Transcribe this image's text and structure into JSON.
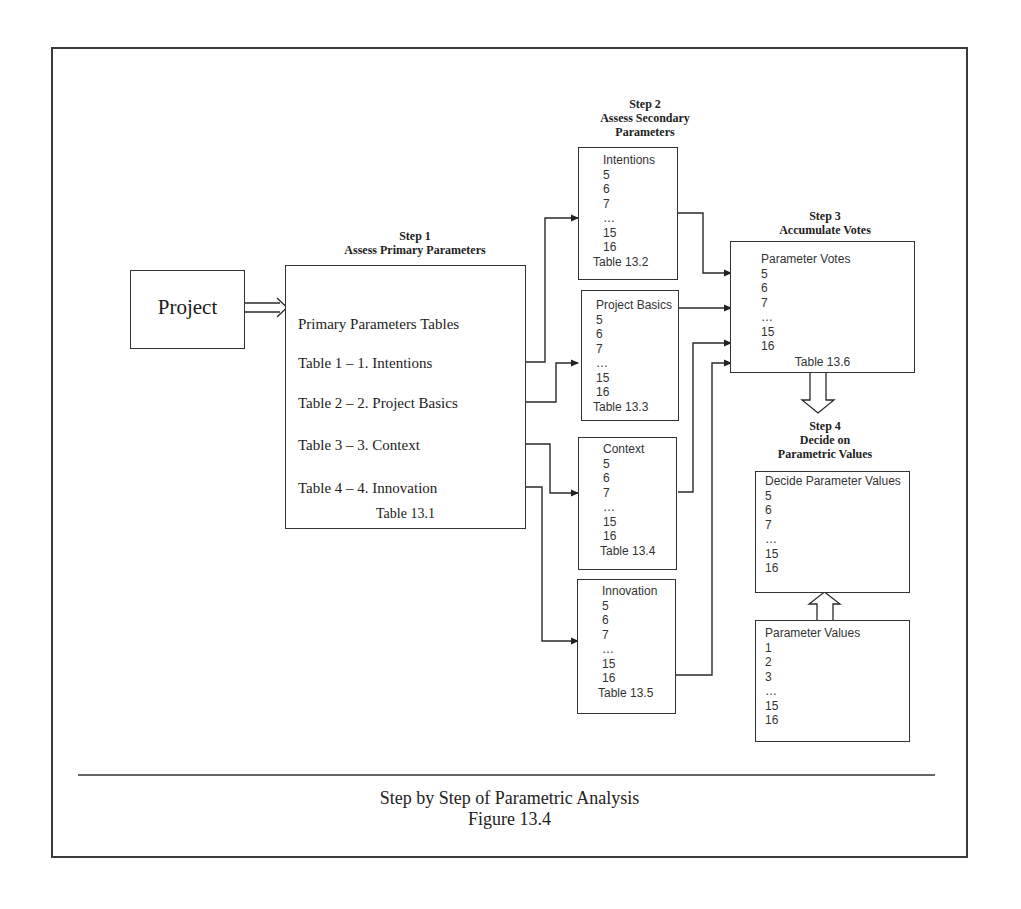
{
  "project": {
    "label": "Project"
  },
  "step1": {
    "heading": "Step 1",
    "title": "Assess Primary Parameters",
    "box_title": "Primary Parameters Tables",
    "rows": [
      "Table 1 – 1. Intentions",
      "Table 2 – 2. Project Basics",
      "Table 3 – 3. Context",
      "Table 4 – 4. Innovation"
    ],
    "table_ref": "Table 13.1"
  },
  "step2": {
    "heading": "Step 2",
    "title_line1": "Assess Secondary",
    "title_line2": "Parameters",
    "boxes": [
      {
        "title": "Intentions",
        "items": [
          "5",
          "6",
          "7",
          "…",
          "15",
          "16"
        ],
        "table_ref": "Table 13.2"
      },
      {
        "title": "Project Basics",
        "items": [
          "5",
          "6",
          "7",
          "…",
          "15",
          "16"
        ],
        "table_ref": "Table 13.3"
      },
      {
        "title": "Context",
        "items": [
          "5",
          "6",
          "7",
          "…",
          "15",
          "16"
        ],
        "table_ref": "Table 13.4"
      },
      {
        "title": "Innovation",
        "items": [
          "5",
          "6",
          "7",
          "…",
          "15",
          "16"
        ],
        "table_ref": "Table 13.5"
      }
    ]
  },
  "step3": {
    "heading": "Step 3",
    "title": "Accumulate Votes",
    "box": {
      "title": "Parameter Votes",
      "items": [
        "5",
        "6",
        "7",
        "…",
        "15",
        "16"
      ],
      "table_ref": "Table 13.6"
    }
  },
  "step4": {
    "heading": "Step 4",
    "title_line1": "Decide on",
    "title_line2": "Parametric Values",
    "box": {
      "title": "Decide Parameter Values",
      "items": [
        "5",
        "6",
        "7",
        "…",
        "15",
        "16"
      ]
    }
  },
  "parameter_values": {
    "title": "Parameter Values",
    "items": [
      "1",
      "2",
      "3",
      "…",
      "15",
      "16"
    ]
  },
  "caption": {
    "title": "Step by Step of Parametric Analysis",
    "figure": "Figure 13.4"
  }
}
